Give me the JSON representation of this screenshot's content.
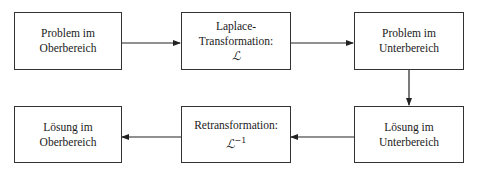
{
  "diagram": {
    "type": "flowchart",
    "nodes": [
      {
        "id": "problem-ober",
        "lines": [
          "Problem im",
          "Oberbereich"
        ]
      },
      {
        "id": "laplace",
        "lines": [
          "Laplace-",
          "Transformation:"
        ],
        "symbol": "ℒ",
        "symbol_sup": ""
      },
      {
        "id": "problem-unter",
        "lines": [
          "Problem im",
          "Unterbereich"
        ]
      },
      {
        "id": "loesung-unter",
        "lines": [
          "Lösung im",
          "Unterbereich"
        ]
      },
      {
        "id": "retrans",
        "lines": [
          "Retransformation:"
        ],
        "symbol": "ℒ",
        "symbol_sup": "−1"
      },
      {
        "id": "loesung-ober",
        "lines": [
          "Lösung im",
          "Oberbereich"
        ]
      }
    ],
    "edges": [
      {
        "from": "problem-ober",
        "to": "laplace"
      },
      {
        "from": "laplace",
        "to": "problem-unter"
      },
      {
        "from": "problem-unter",
        "to": "loesung-unter"
      },
      {
        "from": "loesung-unter",
        "to": "retrans"
      },
      {
        "from": "retrans",
        "to": "loesung-ober"
      }
    ]
  }
}
